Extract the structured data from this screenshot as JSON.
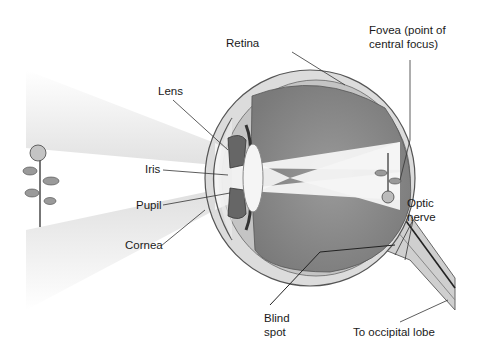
{
  "diagram": {
    "labels": {
      "retina": "Retina",
      "fovea_line1": "Fovea (point of",
      "fovea_line2": "central focus)",
      "lens": "Lens",
      "iris": "Iris",
      "pupil": "Pupil",
      "cornea": "Cornea",
      "optic_line1": "Optic",
      "optic_line2": "nerve",
      "blind_line1": "Blind",
      "blind_line2": "spot",
      "occipital": "To occipital lobe"
    },
    "colors": {
      "vitreous": "#8c8c8c",
      "sclera": "#d9d9d9",
      "outline": "#555555",
      "light_beam": "#f2f2f2",
      "leader": "#333333"
    }
  }
}
